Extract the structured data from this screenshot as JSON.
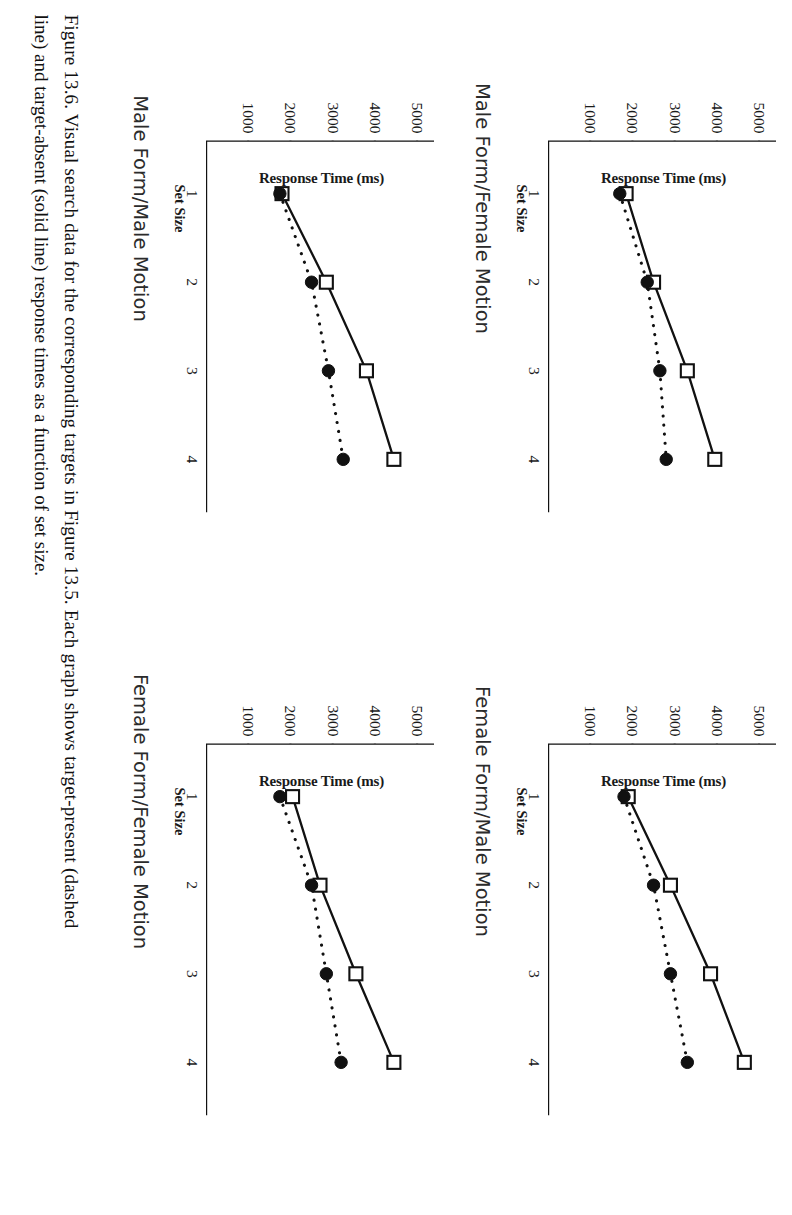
{
  "figure": {
    "caption_line1": "Figure 13.6.  Visual search data for the corresponding targets in Figure 13.5.  Each graph shows target-present (dashed",
    "caption_line2": "line) and target-absent (solid line) response times as a function of set size."
  },
  "axis": {
    "xlabel": "Set Size",
    "ylabel": "Response Time (ms)",
    "xticks": [
      "1",
      "2",
      "3",
      "4"
    ],
    "yticks": [
      "1000",
      "2000",
      "3000",
      "4000",
      "5000"
    ]
  },
  "chart_data": [
    {
      "type": "line",
      "title": "Male Form/Female Motion",
      "xlabel": "Set Size",
      "ylabel": "Response Time (ms)",
      "x": [
        1,
        2,
        3,
        4
      ],
      "xlim": [
        0.4,
        4.6
      ],
      "ylim": [
        0,
        5400
      ],
      "xticks": [
        1,
        2,
        3,
        4
      ],
      "yticks": [
        1000,
        2000,
        3000,
        4000,
        5000
      ],
      "grid": false,
      "legend": "none",
      "series": [
        {
          "name": "target-absent (solid line)",
          "marker": "open-square",
          "line": "solid",
          "values": [
            1850,
            2500,
            3300,
            3950
          ]
        },
        {
          "name": "target-present (dashed line)",
          "marker": "filled-circle",
          "line": "dashed",
          "values": [
            1700,
            2350,
            2650,
            2800
          ]
        }
      ]
    },
    {
      "type": "line",
      "title": "Male Form/Male Motion",
      "xlabel": "Set Size",
      "ylabel": "Response Time (ms)",
      "x": [
        1,
        2,
        3,
        4
      ],
      "xlim": [
        0.4,
        4.6
      ],
      "ylim": [
        0,
        5400
      ],
      "xticks": [
        1,
        2,
        3,
        4
      ],
      "yticks": [
        1000,
        2000,
        3000,
        4000,
        5000
      ],
      "grid": false,
      "legend": "none",
      "series": [
        {
          "name": "target-absent (solid line)",
          "marker": "open-square",
          "line": "solid",
          "values": [
            1800,
            2850,
            3800,
            4450
          ]
        },
        {
          "name": "target-present (dashed line)",
          "marker": "filled-circle",
          "line": "dashed",
          "values": [
            1750,
            2500,
            2900,
            3250
          ]
        }
      ]
    },
    {
      "type": "line",
      "title": "Female Form/Male Motion",
      "xlabel": "Set Size",
      "ylabel": "Response Time (ms)",
      "x": [
        1,
        2,
        3,
        4
      ],
      "xlim": [
        0.4,
        4.6
      ],
      "ylim": [
        0,
        5400
      ],
      "xticks": [
        1,
        2,
        3,
        4
      ],
      "yticks": [
        1000,
        2000,
        3000,
        4000,
        5000
      ],
      "grid": false,
      "legend": "none",
      "series": [
        {
          "name": "target-absent (solid line)",
          "marker": "open-square",
          "line": "solid",
          "values": [
            1900,
            2900,
            3850,
            4650
          ]
        },
        {
          "name": "target-present (dashed line)",
          "marker": "filled-circle",
          "line": "dashed",
          "values": [
            1800,
            2500,
            2900,
            3300
          ]
        }
      ]
    },
    {
      "type": "line",
      "title": "Female Form/Female Motion",
      "xlabel": "Set Size",
      "ylabel": "Response Time (ms)",
      "x": [
        1,
        2,
        3,
        4
      ],
      "xlim": [
        0.4,
        4.6
      ],
      "ylim": [
        0,
        5400
      ],
      "xticks": [
        1,
        2,
        3,
        4
      ],
      "yticks": [
        1000,
        2000,
        3000,
        4000,
        5000
      ],
      "grid": false,
      "legend": "none",
      "series": [
        {
          "name": "target-absent (solid line)",
          "marker": "open-square",
          "line": "solid",
          "values": [
            2050,
            2700,
            3550,
            4450
          ]
        },
        {
          "name": "target-present (dashed line)",
          "marker": "filled-circle",
          "line": "dashed",
          "values": [
            1750,
            2500,
            2850,
            3200
          ]
        }
      ]
    }
  ]
}
